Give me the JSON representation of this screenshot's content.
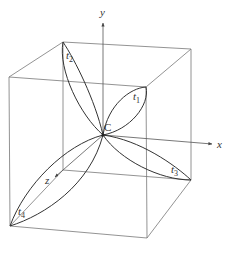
{
  "diagram": {
    "type": "3d-cube-with-axes-and-petal-curves",
    "axes": {
      "x": {
        "label": "x"
      },
      "y": {
        "label": "y"
      },
      "z": {
        "label": "z"
      }
    },
    "center": {
      "label": "C"
    },
    "curves": [
      {
        "id": "t1",
        "label": "t",
        "subscript": "1"
      },
      {
        "id": "t2",
        "label": "t",
        "subscript": "2"
      },
      {
        "id": "t3",
        "label": "t",
        "subscript": "3"
      },
      {
        "id": "t4",
        "label": "t",
        "subscript": "4"
      }
    ],
    "colors": {
      "cube_edge": "#777777",
      "curve": "#333333",
      "axis": "#555555"
    }
  }
}
